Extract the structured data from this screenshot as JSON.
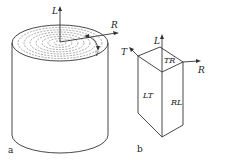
{
  "figure": {
    "panel_a": {
      "caption": "a",
      "axes": {
        "longitudinal": "L",
        "radial": "R",
        "tangential": "T"
      }
    },
    "panel_b": {
      "caption": "b",
      "axes": {
        "longitudinal": "L",
        "radial": "R",
        "tangential": "T"
      },
      "faces": {
        "top": "TR",
        "left": "LT",
        "right": "RL"
      }
    }
  }
}
